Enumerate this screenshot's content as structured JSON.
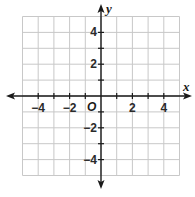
{
  "chart_data": {
    "type": "scatter",
    "title": "",
    "xlabel": "x",
    "ylabel": "y",
    "origin_label": "O",
    "xlim": [
      -5,
      5
    ],
    "ylim": [
      -5,
      5
    ],
    "grid": true,
    "grid_step": 1,
    "x_ticks": [
      -4,
      -2,
      2,
      4
    ],
    "y_ticks": [
      4,
      2,
      -2,
      -4
    ],
    "x_tick_labels": [
      "−4",
      "−2",
      "2",
      "4"
    ],
    "y_tick_labels": [
      "4",
      "2",
      "−2",
      "−4"
    ],
    "series": [],
    "colors": {
      "grid": "#c8c8c8",
      "axis": "#1a1a1a",
      "background": "#ffffff"
    }
  }
}
